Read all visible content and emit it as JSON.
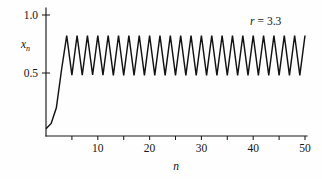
{
  "figure": {
    "background_color": "#fefefe",
    "line_color": "#121212",
    "axis_color": "#1a1a1a"
  },
  "labels": {
    "y_axis_title": "x",
    "y_axis_title_sub": "n",
    "x_axis_title": "n",
    "annotation_param": "r",
    "annotation_equals": "=",
    "annotation_value": "3.3",
    "annotation_full": "r = 3.3"
  },
  "axes": {
    "y_ticks": [
      "1.0",
      "0.5"
    ],
    "x_ticks_labeled": [
      "10",
      "20",
      "30",
      "40",
      "50"
    ]
  },
  "chart_data": {
    "type": "line",
    "title": "",
    "subtitle": "",
    "xlabel": "n",
    "ylabel": "x_n",
    "annotations": [
      {
        "text": "r = 3.3",
        "x": 44,
        "y": 0.95
      }
    ],
    "grid": false,
    "legend": null,
    "xlim": [
      0,
      51
    ],
    "ylim": [
      0,
      1.04
    ],
    "xticks": [
      0,
      5,
      10,
      15,
      20,
      25,
      30,
      35,
      40,
      45,
      50
    ],
    "xtick_labels": [
      "",
      "",
      "10",
      "",
      "20",
      "",
      "30",
      "",
      "40",
      "",
      "50"
    ],
    "yticks": [
      0.5,
      1.0
    ],
    "ytick_labels": [
      "0.5",
      "1.0"
    ],
    "parameters": {
      "r": 3.3,
      "x0": 0.02,
      "map": "logistic"
    },
    "x": [
      0,
      1,
      2,
      3,
      4,
      5,
      6,
      7,
      8,
      9,
      10,
      11,
      12,
      13,
      14,
      15,
      16,
      17,
      18,
      19,
      20,
      21,
      22,
      23,
      24,
      25,
      26,
      27,
      28,
      29,
      30,
      31,
      32,
      33,
      34,
      35,
      36,
      37,
      38,
      39,
      40,
      41,
      42,
      43,
      44,
      45,
      46,
      47,
      48,
      49,
      50
    ],
    "values": [
      0.02,
      0.065,
      0.2,
      0.528,
      0.823,
      0.481,
      0.823,
      0.481,
      0.822,
      0.483,
      0.822,
      0.482,
      0.823,
      0.48,
      0.823,
      0.48,
      0.823,
      0.48,
      0.823,
      0.48,
      0.823,
      0.48,
      0.823,
      0.48,
      0.823,
      0.48,
      0.823,
      0.48,
      0.823,
      0.48,
      0.823,
      0.48,
      0.823,
      0.48,
      0.823,
      0.48,
      0.823,
      0.48,
      0.823,
      0.48,
      0.823,
      0.48,
      0.823,
      0.48,
      0.823,
      0.48,
      0.823,
      0.48,
      0.823,
      0.48,
      0.823
    ],
    "series": [
      {
        "name": "x_n",
        "color": "#121212",
        "values": [
          0.02,
          0.065,
          0.2,
          0.528,
          0.823,
          0.481,
          0.823,
          0.481,
          0.822,
          0.483,
          0.822,
          0.482,
          0.823,
          0.48,
          0.823,
          0.48,
          0.823,
          0.48,
          0.823,
          0.48,
          0.823,
          0.48,
          0.823,
          0.48,
          0.823,
          0.48,
          0.823,
          0.48,
          0.823,
          0.48,
          0.823,
          0.48,
          0.823,
          0.48,
          0.823,
          0.48,
          0.823,
          0.48,
          0.823,
          0.48,
          0.823,
          0.48,
          0.823,
          0.48,
          0.823,
          0.48,
          0.823,
          0.48,
          0.823,
          0.48,
          0.823
        ]
      }
    ]
  }
}
